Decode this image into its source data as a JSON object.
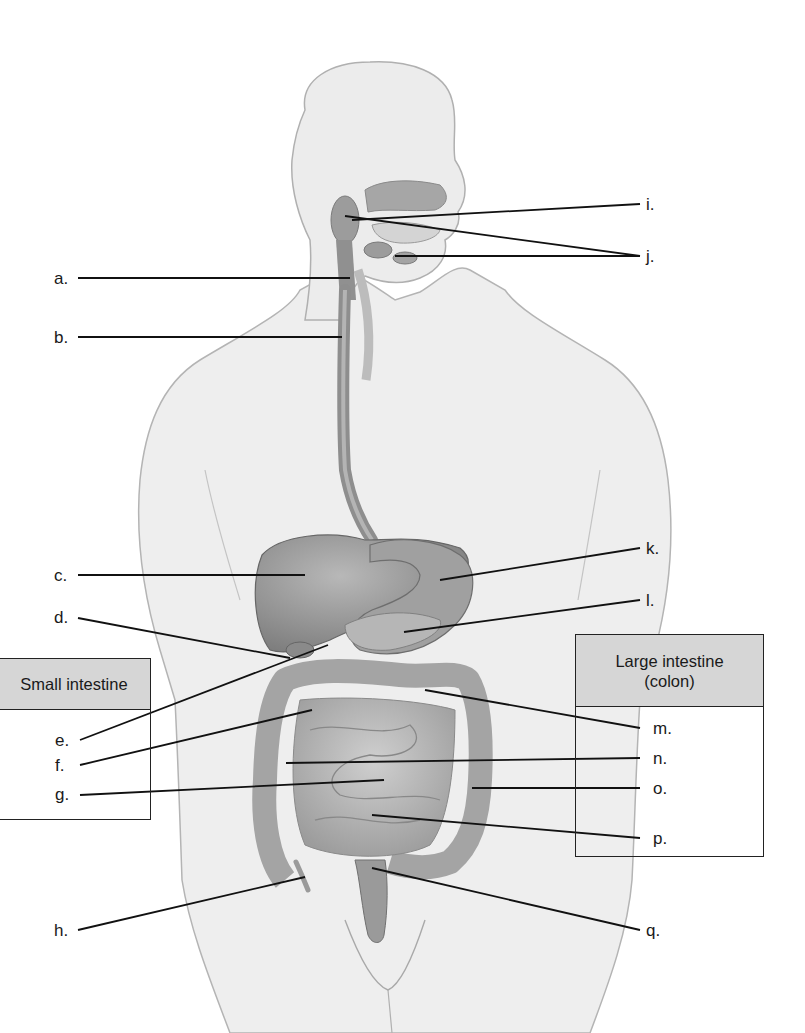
{
  "diagram": {
    "colors": {
      "skin": "#ececec",
      "skin_outline": "#a8a8a8",
      "organ": "#9a9a9a",
      "organ_dark": "#7c7c7c",
      "intestine": "#b2b2b2",
      "leader_line": "#111111",
      "box_header": "#d6d6d6"
    },
    "labels": {
      "a": "a.",
      "b": "b.",
      "c": "c.",
      "d": "d.",
      "e": "e.",
      "f": "f.",
      "g": "g.",
      "h": "h.",
      "i": "i.",
      "j": "j.",
      "k": "k.",
      "l": "l.",
      "m": "m.",
      "n": "n.",
      "o": "o.",
      "p": "p.",
      "q": "q."
    },
    "boxes": {
      "small_intestine": {
        "title": "Small intestine",
        "members": [
          "e",
          "f",
          "g"
        ]
      },
      "large_intestine": {
        "title_line1": "Large intestine",
        "title_line2": "(colon)",
        "members": [
          "m",
          "n",
          "o",
          "p"
        ]
      }
    }
  }
}
